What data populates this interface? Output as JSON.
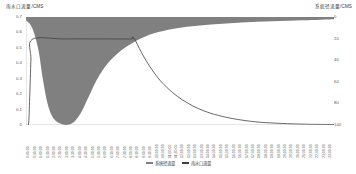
{
  "chart_data": {
    "type": "area",
    "title": "",
    "left_axis": {
      "label": "雨水口流量/CMS",
      "ticks": [
        0.7,
        0.6,
        0.5,
        0.4,
        0.3,
        0.2,
        0.1,
        0
      ],
      "tick_labels": [
        "0.7",
        "0.6",
        "0.5",
        "0.4",
        "0.3",
        "0.2",
        "0.1",
        "0"
      ],
      "ylim": [
        0,
        0.7
      ],
      "inverted": false
    },
    "right_axis": {
      "label": "系统径流量/CMS",
      "ticks": [
        0,
        20,
        40,
        60,
        80,
        100
      ],
      "tick_labels": [
        "0",
        "20",
        "40",
        "60",
        "80",
        "100"
      ],
      "ylim": [
        0,
        100
      ],
      "inverted": true
    },
    "xlabel": "",
    "grid": false,
    "legend_position": "bottom",
    "legend": [
      {
        "name": "系统径流量",
        "color": "#808080",
        "style": "area"
      },
      {
        "name": "雨水口流量",
        "color": "#404040",
        "style": "line"
      }
    ],
    "x_tick_labels": [
      "0:00:00",
      "0:30:00",
      "1:00:00",
      "1:30:00",
      "2:00:00",
      "2:30:00",
      "3:00:00",
      "3:30:00",
      "4:00:00",
      "4:30:00",
      "5:00:00",
      "5:30:00",
      "6:00:00",
      "6:30:00",
      "7:00:00",
      "7:30:00",
      "8:00:00",
      "8:30:00",
      "9:00:00",
      "9:30:00",
      "10:00:00",
      "10:30:00",
      "11:00:00",
      "11:30:00",
      "12:00:00",
      "12:30:00",
      "13:00:00",
      "13:30:00",
      "14:00:00",
      "14:30:00",
      "15:00:00",
      "15:30:00",
      "16:00:00",
      "16:30:00",
      "17:00:00",
      "17:30:00",
      "18:00:00",
      "18:30:00",
      "19:00:00",
      "19:30:00",
      "20:00:00",
      "20:30:00",
      "21:00:00",
      "21:30:00",
      "22:00:00",
      "22:30:00",
      "23:00:00",
      "23:30:00"
    ],
    "series": [
      {
        "name": "系统径流量",
        "axis": "right",
        "type": "area",
        "color": "#808080",
        "note": "Filled band from top of plot (0 on inverted right axis) down to a sharp trough near 100; widest dip occurs early then recovers toward the top-right.",
        "x_fraction": [
          0.0,
          0.02,
          0.04,
          0.055,
          0.07,
          0.085,
          0.1,
          0.115,
          0.13,
          0.145,
          0.16,
          0.18,
          0.2,
          0.23,
          0.265,
          0.3,
          0.34,
          0.38,
          0.43,
          0.5,
          0.6,
          0.7,
          0.8,
          0.9,
          1.0
        ],
        "values": [
          3,
          10,
          30,
          58,
          80,
          92,
          97,
          99,
          100,
          99,
          96,
          88,
          76,
          58,
          43,
          33,
          25,
          19,
          14,
          10,
          7,
          5,
          4,
          3,
          2
        ]
      },
      {
        "name": "雨水口流量",
        "axis": "left",
        "type": "line",
        "color": "#404040",
        "note": "Rises steeply from 0 to a flat plateau at about 0.56, holds the plateau, peaks slightly at 0.57 then decays exponentially back to near 0.",
        "x_fraction": [
          0.0,
          0.008,
          0.012,
          0.016,
          0.02,
          0.12,
          0.24,
          0.34,
          0.345,
          0.352,
          0.362,
          0.375,
          0.392,
          0.412,
          0.435,
          0.462,
          0.492,
          0.525,
          0.56,
          0.6,
          0.65,
          0.7,
          0.76,
          0.83,
          0.91,
          1.0
        ],
        "values": [
          0.0,
          0.0,
          0.18,
          0.42,
          0.555,
          0.558,
          0.558,
          0.558,
          0.57,
          0.56,
          0.52,
          0.47,
          0.41,
          0.35,
          0.29,
          0.235,
          0.185,
          0.142,
          0.106,
          0.076,
          0.05,
          0.032,
          0.018,
          0.01,
          0.005,
          0.003
        ]
      }
    ]
  }
}
